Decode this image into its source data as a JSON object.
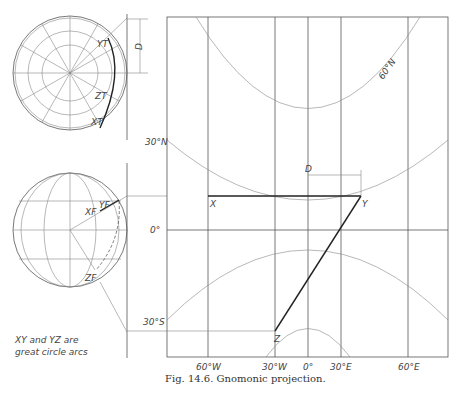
{
  "figure": {
    "caption": "Fig. 14.6. Gnomonic projection.",
    "note_line1": "XY and YZ are",
    "note_line2": "great circle arcs"
  },
  "top_globe": {
    "labels": {
      "D": "D",
      "Y": "YT",
      "Z": "ZT",
      "X": "XT"
    }
  },
  "bottom_globe": {
    "labels": {
      "X": "XF",
      "Y": "YF",
      "Z": "ZF"
    }
  },
  "projection": {
    "latitude_labels": [
      "60°N",
      "30°N",
      "0°",
      "30°S"
    ],
    "longitude_labels": [
      "60°W",
      "30°W",
      "0°",
      "30°E",
      "60°E"
    ],
    "points": {
      "X": "X",
      "Y": "Y",
      "Z": "Z"
    },
    "dimension_label": "D"
  }
}
